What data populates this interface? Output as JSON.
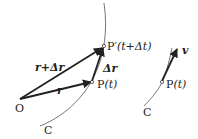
{
  "diagram": {
    "left": {
      "origin_label": "O",
      "curve_label": "C",
      "point_p_label": "P",
      "point_p_arg": "(t)",
      "point_p2_label": "P′",
      "point_p2_arg": "(t+Δt)",
      "vec_r_label": "r",
      "vec_r_plus_dr_label": "r+Δr",
      "vec_dr_label": "Δr"
    },
    "right": {
      "curve_label": "C",
      "point_p_label": "P",
      "point_p_arg": "(t)",
      "vec_v_label": "v"
    },
    "colors": {
      "line": "#222222",
      "curve": "#555555",
      "background": "#ffffff"
    }
  }
}
